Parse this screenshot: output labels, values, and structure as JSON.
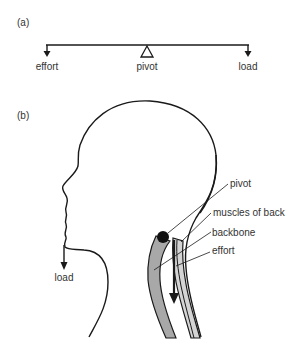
{
  "panels": {
    "a": {
      "label": "(a)",
      "lever": {
        "left_label": "effort",
        "center_label": "pivot",
        "right_label": "load"
      }
    },
    "b": {
      "label": "(b)",
      "labels": {
        "pivot": "pivot",
        "muscles": "muscles of back",
        "backbone": "backbone",
        "effort": "effort",
        "load": "load"
      }
    }
  },
  "colors": {
    "line": "#1a1a1a",
    "text": "#333333",
    "backbone_fill": "#a8a8a8",
    "muscle_fill": "#d4d4d4",
    "pivot_fill": "#111111"
  }
}
